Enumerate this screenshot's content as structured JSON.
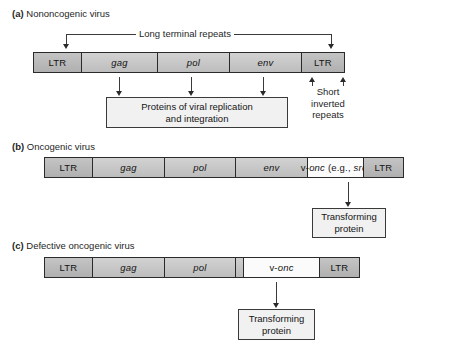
{
  "figure": {
    "title_visible": false,
    "colors": {
      "segment_gray": "#c8c8c8",
      "segment_white": "#fbfbfb",
      "box_fill": "#f1f1f1",
      "stroke": "#2a2a2a",
      "text": "#141414"
    }
  },
  "panels": [
    {
      "id": "a",
      "letter": "(a)",
      "title": "Nononcogenic virus",
      "top_callout": "Long terminal repeats",
      "segments": [
        {
          "label": "LTR",
          "style": "ltr",
          "italic": false
        },
        {
          "label": "gag",
          "style": "gene",
          "italic": true
        },
        {
          "label": "pol",
          "style": "gene",
          "italic": true
        },
        {
          "label": "env",
          "style": "gene",
          "italic": true
        },
        {
          "label": "LTR",
          "style": "ltr",
          "italic": false
        }
      ],
      "output_box": "Proteins of viral replication and integration",
      "output_box_line1": "Proteins of viral replication",
      "output_box_line2": "and integration",
      "side_callout_line1": "Short",
      "side_callout_line2": "inverted",
      "side_callout_line3": "repeats",
      "side_callout": "Short inverted repeats"
    },
    {
      "id": "b",
      "letter": "(b)",
      "title": "Oncogenic virus",
      "segments": [
        {
          "label": "LTR",
          "style": "ltr",
          "italic": false
        },
        {
          "label": "gag",
          "style": "gene",
          "italic": true
        },
        {
          "label": "pol",
          "style": "gene",
          "italic": true
        },
        {
          "label": "env",
          "style": "gene",
          "italic": true
        },
        {
          "label": "v-onc (e.g., src)",
          "style": "onc-white",
          "italic": false
        },
        {
          "label": "LTR",
          "style": "ltr",
          "italic": false
        }
      ],
      "onc_prefix": "v-",
      "onc_gene": "onc",
      "onc_middle": " (e.g., ",
      "onc_example": "src",
      "onc_suffix": ")",
      "output_box_line1": "Transforming",
      "output_box_line2": "protein",
      "output_box": "Transforming protein"
    },
    {
      "id": "c",
      "letter": "(c)",
      "title": "Defective oncogenic virus",
      "segments": [
        {
          "label": "LTR",
          "style": "ltr",
          "italic": false
        },
        {
          "label": "gag",
          "style": "gene",
          "italic": true
        },
        {
          "label": "pol",
          "style": "gene",
          "italic": true
        },
        {
          "label": "",
          "style": "spacer",
          "italic": false
        },
        {
          "label": "v-onc",
          "style": "onc-white",
          "italic": false
        },
        {
          "label": "LTR",
          "style": "ltr",
          "italic": false
        }
      ],
      "onc_prefix": "v-",
      "onc_gene": "onc",
      "output_box_line1": "Transforming",
      "output_box_line2": "protein",
      "output_box": "Transforming protein"
    }
  ]
}
